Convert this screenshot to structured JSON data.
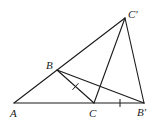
{
  "diagram": {
    "type": "geometry",
    "points": {
      "A": {
        "label": "A",
        "x": 14,
        "y": 103
      },
      "B": {
        "label": "B",
        "x": 57,
        "y": 70
      },
      "C": {
        "label": "C",
        "x": 94,
        "y": 103
      },
      "Bp": {
        "label": "B′",
        "x": 144,
        "y": 103
      },
      "Cp": {
        "label": "C′",
        "x": 125,
        "y": 18
      }
    },
    "segments": [
      {
        "from": "A",
        "to": "Cp"
      },
      {
        "from": "A",
        "to": "Bp"
      },
      {
        "from": "B",
        "to": "C"
      },
      {
        "from": "B",
        "to": "Bp"
      },
      {
        "from": "C",
        "to": "Cp"
      },
      {
        "from": "Cp",
        "to": "Bp"
      }
    ],
    "equal_marks": [
      {
        "segment": "BC",
        "ticks": 1
      },
      {
        "segment": "CB′",
        "ticks": 1
      }
    ],
    "labels": {
      "A": "A",
      "B": "B",
      "C": "C",
      "B_prime": "B′",
      "C_prime": "C′"
    },
    "colors": {
      "line": "#1a1a1a",
      "background": "#ffffff"
    }
  }
}
